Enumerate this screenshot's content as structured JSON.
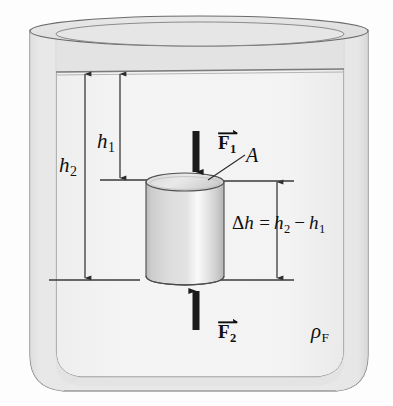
{
  "figure": {
    "name": "buoyancy-pressure-diagram",
    "labels": {
      "h1": {
        "symbol": "h",
        "subscript": "1"
      },
      "h2": {
        "symbol": "h",
        "subscript": "2"
      },
      "force_top": {
        "symbol": "F",
        "subscript": "1"
      },
      "force_bottom": {
        "symbol": "F",
        "subscript": "2"
      },
      "area": {
        "symbol": "A"
      },
      "delta_h_equation": {
        "lhs_symbol": "h",
        "delta": "Δ",
        "equals": "=",
        "minus": "−",
        "term1_symbol": "h",
        "term1_sub": "2",
        "term2_symbol": "h",
        "term2_sub": "1"
      },
      "fluid_density": {
        "symbol": "ρ",
        "subscript": "F"
      }
    },
    "colors": {
      "outline": "#3f3f3f",
      "arrow": "#1b1b1b",
      "fluid_fill": "#f2f2f2",
      "wall_fill": "#e4e4e4",
      "rim_fill": "#e0e0e0",
      "cylinder_light": "#fbfbfb",
      "cylinder_mid": "#d8d8d8",
      "cylinder_dark": "#c2c2c2",
      "page_background": "#fdfdfd",
      "text": "#100f0f"
    },
    "geometry": {
      "fluid_surface_y": 73,
      "cylinder_top_y": 180,
      "cylinder_bottom_y": 280,
      "cylinder_left_x": 145,
      "cylinder_right_x": 225,
      "h1_line_x": 120,
      "h2_line_x": 85,
      "delta_h_line_x": 277
    }
  }
}
